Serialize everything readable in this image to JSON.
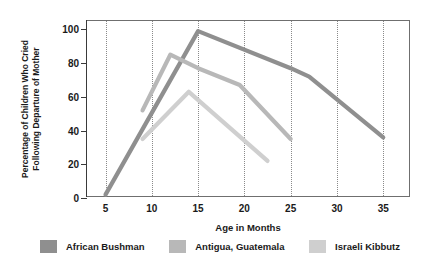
{
  "chart_data": {
    "type": "line",
    "title": "",
    "xlabel": "Age in Months",
    "ylabel": "Percentage of Children Who Cried Following Departure of Mother",
    "ylabel_line1": "Percentage of Children Who Cried",
    "ylabel_line2": "Following Departure of Mother",
    "xlim": [
      3,
      38
    ],
    "ylim": [
      0,
      105
    ],
    "xticks": [
      5,
      10,
      15,
      20,
      25,
      30,
      35
    ],
    "yticks": [
      0,
      20,
      40,
      60,
      80,
      100
    ],
    "grid": "vertical-dotted",
    "legend_position": "below",
    "series": [
      {
        "name": "African Bushman",
        "color": "#8f8f8f",
        "x": [
          5,
          15,
          25,
          27,
          35
        ],
        "y": [
          2,
          99,
          77,
          72,
          36
        ]
      },
      {
        "name": "Antigua, Guatemala",
        "color": "#b8b8b8",
        "x": [
          9,
          12,
          15,
          19.5,
          25
        ],
        "y": [
          52,
          85,
          77,
          67,
          35
        ]
      },
      {
        "name": "Israeli Kibbutz",
        "color": "#cfcfcf",
        "x": [
          9,
          14,
          22.5
        ],
        "y": [
          35,
          63,
          22
        ]
      }
    ]
  },
  "axis": {
    "y_tick_labels": [
      "0",
      "20",
      "40",
      "60",
      "80",
      "100"
    ],
    "x_tick_labels": [
      "5",
      "10",
      "15",
      "20",
      "25",
      "30",
      "35"
    ],
    "x_title": "Age in Months",
    "y_title_line1": "Percentage of Children Who Cried",
    "y_title_line2": "Following Departure of Mother"
  },
  "legend": {
    "items": [
      {
        "label": "African Bushman",
        "color": "#8f8f8f"
      },
      {
        "label": "Antigua, Guatemala",
        "color": "#b8b8b8"
      },
      {
        "label": "Israeli Kibbutz",
        "color": "#cfcfcf"
      }
    ]
  },
  "colors": {
    "background": "#e8e8e8",
    "plot_background": "#ffffff",
    "axis": "#3a3a3a",
    "grid": "#8a8a8a",
    "text": "#1a1a1a"
  }
}
